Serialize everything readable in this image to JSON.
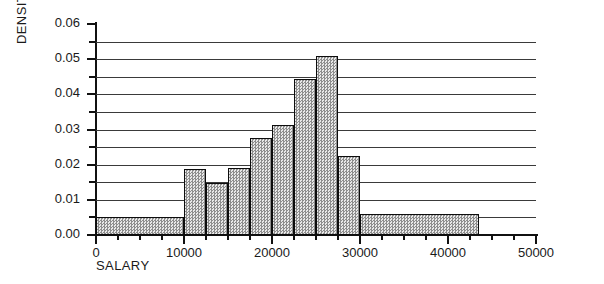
{
  "chart_data": {
    "type": "bar",
    "title": "",
    "subtitle": "",
    "xlabel": "SALARY",
    "ylabel": "DENSITY",
    "xlim": [
      0,
      50000
    ],
    "ylim": [
      0.0,
      0.06
    ],
    "grid": true,
    "legend": null,
    "bin_width": 2500,
    "x_major_ticks": [
      0,
      10000,
      20000,
      30000,
      40000,
      50000
    ],
    "x_major_tick_labels": [
      "0",
      "10000",
      "20000",
      "30000",
      "40000",
      "50000"
    ],
    "x_minor_tick_step": 2500,
    "y_major_ticks": [
      0.0,
      0.01,
      0.02,
      0.03,
      0.04,
      0.05,
      0.06
    ],
    "y_major_tick_labels": [
      "0.00",
      "0.01",
      "0.02",
      "0.03",
      "0.04",
      "0.05",
      "0.06"
    ],
    "y_minor_ticks": [
      0.005,
      0.015,
      0.025,
      0.035,
      0.045,
      0.055
    ],
    "gridline_values": [
      0.005,
      0.01,
      0.015,
      0.02,
      0.025,
      0.03,
      0.035,
      0.04,
      0.045,
      0.05,
      0.055
    ],
    "bars": [
      {
        "x0": 0,
        "x1": 10000,
        "value": 0.005
      },
      {
        "x0": 10000,
        "x1": 12500,
        "value": 0.0188
      },
      {
        "x0": 12500,
        "x1": 15000,
        "value": 0.0148
      },
      {
        "x0": 15000,
        "x1": 17500,
        "value": 0.019
      },
      {
        "x0": 17500,
        "x1": 20000,
        "value": 0.0275
      },
      {
        "x0": 20000,
        "x1": 22500,
        "value": 0.0313
      },
      {
        "x0": 22500,
        "x1": 25000,
        "value": 0.0445
      },
      {
        "x0": 25000,
        "x1": 27500,
        "value": 0.051
      },
      {
        "x0": 27500,
        "x1": 30000,
        "value": 0.0225
      },
      {
        "x0": 30000,
        "x1": 43500,
        "value": 0.006
      }
    ]
  }
}
